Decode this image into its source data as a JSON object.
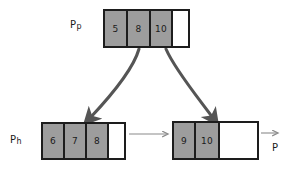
{
  "diagram": {
    "background_color": "#ffffff",
    "cell_fill_color": "#9d9d9d",
    "cell_empty_color": "#ffffff",
    "border_color": "#1d1d1d",
    "thick_arrow_color": "#555555",
    "thin_arrow_color": "#8a8a8a"
  },
  "nodes": [
    {
      "id": "parent",
      "label_main": "P",
      "label_sub": "p",
      "cells": [
        {
          "value": "5",
          "filled": true
        },
        {
          "value": "8",
          "filled": true
        },
        {
          "value": "10",
          "filled": true
        },
        {
          "value": "",
          "filled": false
        }
      ]
    },
    {
      "id": "left-child",
      "label_main": "P",
      "label_sub": "h",
      "cells": [
        {
          "value": "6",
          "filled": true
        },
        {
          "value": "7",
          "filled": true
        },
        {
          "value": "8",
          "filled": true
        },
        {
          "value": "",
          "filled": false
        }
      ]
    },
    {
      "id": "right-child",
      "label_main": "P",
      "label_sub": "",
      "cells": [
        {
          "value": "9",
          "filled": true
        },
        {
          "value": "10",
          "filled": true
        },
        {
          "value": "",
          "filled": false
        },
        {
          "value": "",
          "filled": false
        }
      ]
    }
  ]
}
